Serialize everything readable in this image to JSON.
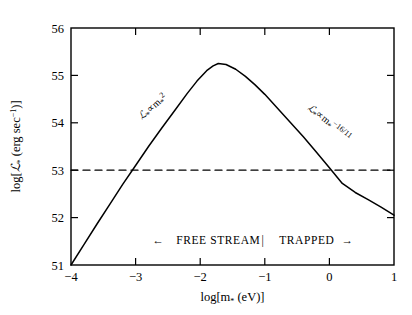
{
  "figure": {
    "name": "stellar-luminosity-vs-mass-plot",
    "background_color": "#ffffff",
    "line_color": "#000000"
  },
  "axes": {
    "x": {
      "title_prefix": "log[m",
      "title_sub": "*",
      "title_suffix": " (eV)]",
      "title_full": "log[m* (eV)]",
      "min": -4,
      "max": 1,
      "ticks": [
        -4,
        -3,
        -2,
        -1,
        0,
        1
      ],
      "tick_labels": [
        "−4",
        "−3",
        "−2",
        "−1",
        "0",
        "1"
      ]
    },
    "y": {
      "title_prefix": "log[",
      "title_script": "ℒ",
      "title_sub": "*",
      "title_suffix": " (erg sec",
      "title_exp": "−1",
      "title_end": ")]",
      "title_full": "log[ℒ* (erg sec−1)]",
      "min": 51,
      "max": 56,
      "ticks": [
        51,
        52,
        53,
        54,
        55,
        56
      ],
      "tick_labels": [
        "51",
        "52",
        "53",
        "54",
        "55",
        "56"
      ]
    }
  },
  "annotations": {
    "left_scaling": {
      "script": "ℒ",
      "sub": "*",
      "prop": "∝",
      "var": "m",
      "var_sub": "*",
      "exponent": "2",
      "full": "ℒ* ∝ m*²",
      "x": -2.9,
      "y": 54.05,
      "rotation": -42
    },
    "right_scaling": {
      "script": "ℒ",
      "sub": "*",
      "prop": "∝",
      "var": "m",
      "var_sub": "*",
      "exponent": "−16/11",
      "full": "ℒ* ∝ m*⁻¹⁶ᐟ¹¹",
      "x": -0.35,
      "y": 54.3,
      "rotation": 38
    },
    "region_bar": {
      "left_arrow": "←",
      "left_label": "FREE STREAM",
      "divider": "|",
      "right_label": "TRAPPED",
      "right_arrow": "→",
      "full": "← FREE STREAM  |  TRAPPED →",
      "y": 51.45
    }
  },
  "chart_data": {
    "type": "line",
    "title": "",
    "xlabel": "log[m* (eV)]",
    "ylabel": "log[ℒ* (erg sec−1)]",
    "xlim": [
      -4,
      1
    ],
    "ylim": [
      51,
      56
    ],
    "grid": false,
    "legend": null,
    "series": [
      {
        "name": "stellar luminosity curve",
        "style": "solid",
        "color": "#000000",
        "x": [
          -4.0,
          -3.8,
          -3.6,
          -3.4,
          -3.2,
          -3.0,
          -2.8,
          -2.6,
          -2.4,
          -2.2,
          -2.05,
          -1.9,
          -1.8,
          -1.72,
          -1.6,
          -1.45,
          -1.3,
          -1.15,
          -1.0,
          -0.8,
          -0.6,
          -0.4,
          -0.2,
          0.0,
          0.2,
          0.4,
          0.6,
          0.8,
          1.0
        ],
        "y": [
          51.0,
          51.43,
          51.86,
          52.28,
          52.7,
          53.1,
          53.5,
          53.88,
          54.25,
          54.62,
          54.88,
          55.1,
          55.2,
          55.25,
          55.23,
          55.13,
          54.98,
          54.8,
          54.6,
          54.3,
          54.0,
          53.7,
          53.38,
          53.05,
          52.72,
          52.53,
          52.38,
          52.22,
          52.05
        ]
      },
      {
        "name": "reference level",
        "style": "dashed",
        "color": "#000000",
        "x": [
          -4,
          1
        ],
        "y": [
          53.0,
          53.0
        ],
        "constant_y": 53.0
      }
    ]
  }
}
